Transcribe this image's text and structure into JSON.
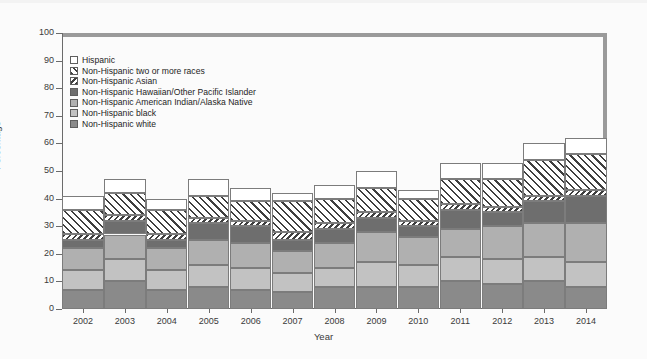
{
  "chart_data": {
    "type": "bar",
    "subtype": "stacked-bar",
    "title": "",
    "xlabel": "Year",
    "ylabel": "Percentage",
    "ylim": [
      0,
      100
    ],
    "yticks": [
      0,
      10,
      20,
      30,
      40,
      50,
      60,
      70,
      80,
      90,
      100
    ],
    "grid": false,
    "legend_position": "upper-left-inside",
    "categories": [
      "2002",
      "2003",
      "2004",
      "2005",
      "2006",
      "2007",
      "2008",
      "2009",
      "2010",
      "2011",
      "2012",
      "2013",
      "2014"
    ],
    "series": [
      {
        "name": "Non-Hispanic white",
        "fill": "fill-deepgray",
        "values": [
          7,
          10,
          7,
          8,
          7,
          6,
          8,
          8,
          8,
          10,
          9,
          10,
          8
        ]
      },
      {
        "name": "Non-Hispanic black",
        "fill": "fill-lightgray",
        "values": [
          7,
          8,
          7,
          8,
          8,
          7,
          7,
          9,
          8,
          9,
          9,
          9,
          9
        ]
      },
      {
        "name": "Non-Hispanic American Indian/Alaska Native",
        "fill": "fill-midgray",
        "values": [
          8,
          9,
          8,
          9,
          9,
          8,
          9,
          11,
          10,
          10,
          12,
          12,
          14
        ]
      },
      {
        "name": "Non-Hispanic Hawaiian/Other Pacific Islander",
        "fill": "fill-darkgray",
        "values": [
          3,
          5,
          3,
          6,
          6,
          4,
          5,
          5,
          4,
          7,
          5,
          8,
          10
        ]
      },
      {
        "name": "Non-Hispanic Asian",
        "fill": "fill-diag-rev",
        "values": [
          2,
          2,
          2,
          2,
          2,
          3,
          2,
          2,
          2,
          2,
          2,
          2,
          2
        ]
      },
      {
        "name": "Non-Hispanic two or more races",
        "fill": "fill-diag-wide",
        "values": [
          9,
          8,
          9,
          8,
          7,
          11,
          9,
          9,
          8,
          9,
          10,
          13,
          13
        ]
      },
      {
        "name": "Hispanic",
        "fill": "fill-white-solid",
        "values": [
          5,
          5,
          4,
          6,
          5,
          3,
          5,
          6,
          3,
          6,
          6,
          6,
          6
        ]
      }
    ],
    "bar_totals": [
      41,
      47,
      40,
      47,
      44,
      42,
      45,
      50,
      43,
      53,
      53,
      60,
      62
    ]
  },
  "legend": {
    "items": [
      {
        "label": "Hispanic",
        "swatch": "fill-white-solid"
      },
      {
        "label": "Non-Hispanic two or more races",
        "swatch": "fill-diag-wide"
      },
      {
        "label": "Non-Hispanic Asian",
        "swatch": "fill-diag-rev"
      },
      {
        "label": "Non-Hispanic Hawaiian/Other Pacific Islander",
        "swatch": "fill-darkgray"
      },
      {
        "label": "Non-Hispanic American Indian/Alaska Native",
        "swatch": "fill-midgray"
      },
      {
        "label": "Non-Hispanic black",
        "swatch": "fill-lightgray"
      },
      {
        "label": "Non-Hispanic white",
        "swatch": "fill-deepgray"
      }
    ]
  },
  "colors": {
    "frame": "#9a9a9a",
    "axis": "#6b6b6b",
    "segment_border": "#7c7c7c",
    "text": "#3a3a3a",
    "background": "#fbfbfb"
  }
}
